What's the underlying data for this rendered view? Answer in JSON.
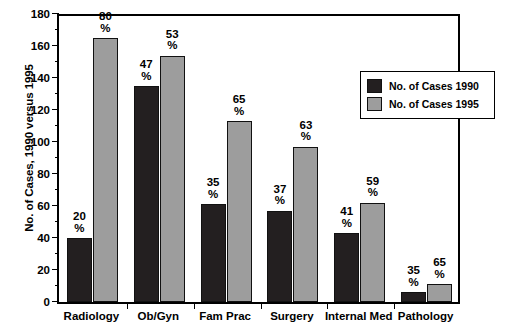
{
  "chart_data": {
    "type": "bar",
    "title": "",
    "xlabel": "",
    "ylabel": "No. of Cases, 1990 versus 1995",
    "ylim": [
      0,
      180
    ],
    "ytick_step": 20,
    "yticks": [
      0,
      20,
      40,
      60,
      80,
      100,
      120,
      140,
      160,
      180
    ],
    "grid": false,
    "legend_position": "upper right",
    "categories": [
      "Radiology",
      "Ob/Gyn",
      "Fam Prac",
      "Surgery",
      "Internal Med",
      "Pathology"
    ],
    "series": [
      {
        "name": "No. of Cases 1990",
        "color": "#231f20",
        "values": [
          40,
          135,
          61,
          57,
          43,
          6
        ],
        "labels": [
          "20\n%",
          "47\n%",
          "35\n%",
          "37\n%",
          "41\n%",
          "35\n%"
        ],
        "label_numbers": [
          "20",
          "47",
          "35",
          "37",
          "41",
          "35"
        ],
        "label_units": [
          "%",
          "%",
          "%",
          "%",
          "%",
          "%"
        ]
      },
      {
        "name": "No. of Cases 1995",
        "color": "#9d9d9d",
        "values": [
          165,
          154,
          113,
          97,
          62,
          11
        ],
        "labels": [
          "80\n%",
          "53\n%",
          "65\n%",
          "63\n%",
          "59\n%",
          "65\n%"
        ],
        "label_numbers": [
          "80",
          "53",
          "65",
          "63",
          "59",
          "65"
        ],
        "label_units": [
          "%",
          "%",
          "%",
          "%",
          "%",
          "%"
        ]
      }
    ]
  },
  "axis": {
    "y_title": "No. of Cases, 1990 versus 1995",
    "tick_labels": [
      "180",
      "160",
      "140",
      "120",
      "100",
      "80",
      "60",
      "40",
      "20",
      "0"
    ]
  },
  "legend": {
    "entries": [
      {
        "label": "No. of Cases 1990",
        "color": "#231f20"
      },
      {
        "label": "No. of Cases 1995",
        "color": "#9d9d9d"
      }
    ]
  }
}
